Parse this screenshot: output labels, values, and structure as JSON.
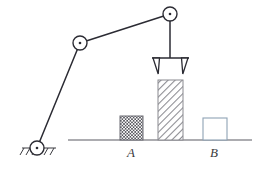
{
  "figure": {
    "background_color": "#ffffff",
    "width": 264,
    "height": 173
  },
  "colors": {
    "link_stroke": "#2b2b33",
    "joint_stroke": "#2b2b33",
    "joint_fill": "#ffffff",
    "joint_dot": "#2b2b33",
    "ground_line": "#5a5a62",
    "hatch_ground": "#3b3b40",
    "gripper_stroke": "#2b2b33",
    "block_a_outline": "#6b6b72",
    "block_a_pattern": "#55555c",
    "block_tall_outline": "#8a8a90",
    "block_tall_pattern": "#8a8a90",
    "block_b_outline": "#8fa3b5",
    "label_color": "#3b3b40"
  },
  "arm": {
    "name": "two-link manipulator",
    "joints": [
      {
        "id": "base",
        "label": "base-pivot",
        "x": 37,
        "y": 148,
        "radius": 7,
        "grounded": true
      },
      {
        "id": "elbow",
        "label": "elbow-joint",
        "x": 80,
        "y": 43,
        "radius": 7,
        "grounded": false
      },
      {
        "id": "wrist",
        "label": "wrist-joint",
        "x": 170,
        "y": 14,
        "radius": 7,
        "grounded": false
      }
    ],
    "links": [
      {
        "id": "lower-link",
        "from": "base",
        "to": "elbow"
      },
      {
        "id": "upper-link",
        "from": "elbow",
        "to": "wrist"
      }
    ],
    "gripper": {
      "label": "gripper",
      "stem_x": 170,
      "stem_top_y": 21,
      "stem_bottom_y": 58,
      "bar_left_x": 152,
      "bar_right_x": 189,
      "bar_y": 58,
      "prong_depth": 16,
      "open": true
    }
  },
  "ground": {
    "line_y": 140,
    "line_x_start": 68,
    "line_x_end": 252,
    "base_hatch": {
      "x_start": 22,
      "x_end": 56,
      "y": 148,
      "tick_count": 6
    }
  },
  "blocks": [
    {
      "id": "block-a",
      "label": "A",
      "pattern": "checkerboard",
      "x": 120,
      "y": 116,
      "width": 23,
      "height": 24,
      "label_x": 131,
      "label_y": 157
    },
    {
      "id": "block-tall",
      "label": "",
      "pattern": "diagonal-hatch",
      "x": 158,
      "y": 80,
      "width": 25,
      "height": 60,
      "label_x": 0,
      "label_y": 0
    },
    {
      "id": "block-b",
      "label": "B",
      "pattern": "empty",
      "x": 203,
      "y": 118,
      "width": 24,
      "height": 22,
      "label_x": 214,
      "label_y": 157
    }
  ],
  "labels": {
    "block_a": "A",
    "block_b": "B"
  }
}
